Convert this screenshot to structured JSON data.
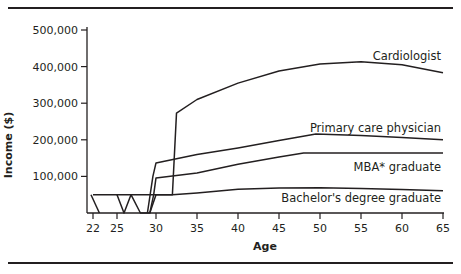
{
  "chart_data": {
    "type": "line",
    "title": "",
    "xlabel": "Age",
    "ylabel": "Income ($)",
    "x_ticks": [
      22,
      25,
      30,
      35,
      40,
      45,
      50,
      55,
      60,
      65
    ],
    "y_ticks": [
      100000,
      200000,
      300000,
      400000,
      500000
    ],
    "y_tick_labels": [
      "100,000",
      "200,000",
      "300,000",
      "400,000",
      "500,000"
    ],
    "xlim": [
      21.5,
      65.5
    ],
    "ylim": [
      0,
      510000
    ],
    "grid": false,
    "legend": "inline labels at right end of each curve",
    "series": [
      {
        "name": "Cardiologist",
        "points": [
          [
            29.2,
            0
          ],
          [
            30,
            50000
          ],
          [
            32,
            50000
          ],
          [
            32.5,
            273000
          ],
          [
            35,
            310000
          ],
          [
            40,
            355000
          ],
          [
            45,
            388000
          ],
          [
            50,
            407000
          ],
          [
            55,
            413000
          ],
          [
            60,
            405000
          ],
          [
            65,
            383000
          ]
        ]
      },
      {
        "name": "Primary care physician",
        "points": [
          [
            28.9,
            0
          ],
          [
            29.6,
            100000
          ],
          [
            30,
            137000
          ],
          [
            35,
            160000
          ],
          [
            40,
            178000
          ],
          [
            45,
            198000
          ],
          [
            49.5,
            216000
          ],
          [
            55,
            212000
          ],
          [
            60,
            206000
          ],
          [
            65,
            200000
          ]
        ]
      },
      {
        "name": "MBA* graduate",
        "points": [
          [
            25,
            50000
          ],
          [
            25.9,
            0
          ],
          [
            26.8,
            50000
          ],
          [
            28,
            0
          ],
          [
            29.2,
            0
          ],
          [
            29.7,
            50000
          ],
          [
            30,
            96000
          ],
          [
            35,
            109000
          ],
          [
            40,
            133000
          ],
          [
            45,
            153000
          ],
          [
            48,
            164000
          ],
          [
            55,
            164000
          ],
          [
            60,
            164000
          ],
          [
            65,
            164000
          ]
        ]
      },
      {
        "name": "Bachelor's degree graduate",
        "points": [
          [
            22,
            50000
          ],
          [
            25,
            50000
          ],
          [
            30,
            50000
          ],
          [
            32,
            50000
          ],
          [
            35,
            55000
          ],
          [
            40,
            65000
          ],
          [
            45,
            68000
          ],
          [
            50,
            69000
          ],
          [
            55,
            67000
          ],
          [
            60,
            64000
          ],
          [
            65,
            61000
          ]
        ]
      },
      {
        "name": "Physician training (school years)",
        "points": [
          [
            21.75,
            50000
          ],
          [
            22.8,
            0
          ]
        ]
      }
    ],
    "labels": [
      {
        "text": "Cardiologist",
        "x": 65,
        "y": 430000
      },
      {
        "text": "Primary care physician",
        "x": 65,
        "y": 232000
      },
      {
        "text": "MBA* graduate",
        "x": 65,
        "y": 125000
      },
      {
        "text": "Bachelor's degree graduate",
        "x": 65,
        "y": 40000
      }
    ]
  },
  "axis": {
    "x_title": "Age",
    "y_title": "Income ($)"
  },
  "colors": {
    "line": "#231f20",
    "text": "#231f20"
  }
}
